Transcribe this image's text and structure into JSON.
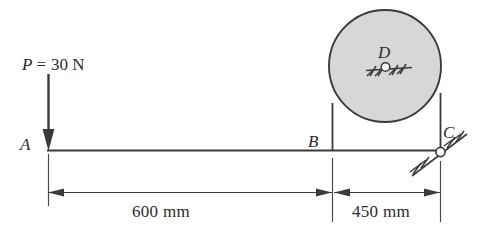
{
  "figure": {
    "type": "statics-free-body-diagram",
    "stroke_color": "#3a3a3a",
    "text_color": "#2b2b2b",
    "cylinder_fill": "#d6d6d6",
    "background": "#ffffff",
    "points": [
      {
        "id": "A",
        "label": "A",
        "x": 48,
        "y": 150,
        "support": "none",
        "label_x": 20,
        "label_y": 138
      },
      {
        "id": "B",
        "label": "B",
        "x": 332,
        "y": 150,
        "support": "contact",
        "label_x": 308,
        "label_y": 135
      },
      {
        "id": "C",
        "label": "C",
        "x": 440,
        "y": 150,
        "support": "pin-inclined",
        "label_x": 443,
        "label_y": 126
      },
      {
        "id": "D",
        "label": "D",
        "x": 385,
        "y": 66,
        "support": "pin-fixed",
        "label_x": 378,
        "label_y": 48
      }
    ],
    "load": {
      "symbol": "P",
      "equals": "=",
      "value": "30 N",
      "full_text": "P = 30 N",
      "direction": "down",
      "applied_at": "A",
      "label_x": 22,
      "label_y": 58,
      "arrow_x": 48,
      "arrow_top_y": 75,
      "arrow_tip_y": 150
    },
    "cylinder": {
      "name": "cylinder-D",
      "center_x": 385,
      "center_y": 66,
      "radius": 56,
      "fill": "#d6d6d6",
      "stroke": "#3a3a3a"
    },
    "beam": {
      "name": "beam-AC",
      "x1": 48,
      "y1": 150,
      "x2": 442,
      "y2": 150
    },
    "dimensions": [
      {
        "id": "dim-AB",
        "label": "600 mm",
        "from": "A",
        "from_x": 48,
        "to": "B",
        "to_x": 332,
        "y": 192,
        "label_x": 132,
        "label_y": 200,
        "value": 600,
        "unit": "mm"
      },
      {
        "id": "dim-BC",
        "label": "450 mm",
        "from": "B",
        "from_x": 332,
        "to": "C",
        "to_x": 440,
        "y": 192,
        "label_x": 352,
        "label_y": 200,
        "value": 450,
        "unit": "mm"
      }
    ],
    "verticals": [
      {
        "id": "vline-B",
        "x": 332,
        "y1": 150,
        "y2": 104
      },
      {
        "id": "vline-C",
        "x": 440,
        "y1": 150,
        "y2": 94
      }
    ],
    "extension_lines": [
      {
        "id": "ext-A",
        "x": 48,
        "y1": 154,
        "y2": 206
      },
      {
        "id": "ext-B",
        "x": 332,
        "y1": 157,
        "y2": 222
      },
      {
        "id": "ext-C",
        "x": 440,
        "y1": 160,
        "y2": 222
      }
    ]
  }
}
